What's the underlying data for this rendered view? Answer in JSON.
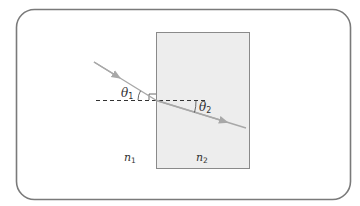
{
  "diagram": {
    "frame": {
      "stroke": "#7a7a7a"
    },
    "slab": {
      "fill": "#ededed",
      "stroke": "#8a8a8a"
    },
    "ray": {
      "color": "#a8a8a8"
    },
    "normal": {
      "color": "#333333",
      "style": "dashed"
    },
    "labels": {
      "theta1": {
        "symbol": "θ",
        "subscript": "1"
      },
      "theta2": {
        "symbol": "θ",
        "subscript": "2"
      },
      "n1": {
        "symbol": "n",
        "subscript": "1"
      },
      "n2": {
        "symbol": "n",
        "subscript": "2"
      }
    },
    "regions": [
      {
        "name": "medium-1",
        "index_label": "n1"
      },
      {
        "name": "medium-2",
        "index_label": "n2"
      }
    ]
  }
}
